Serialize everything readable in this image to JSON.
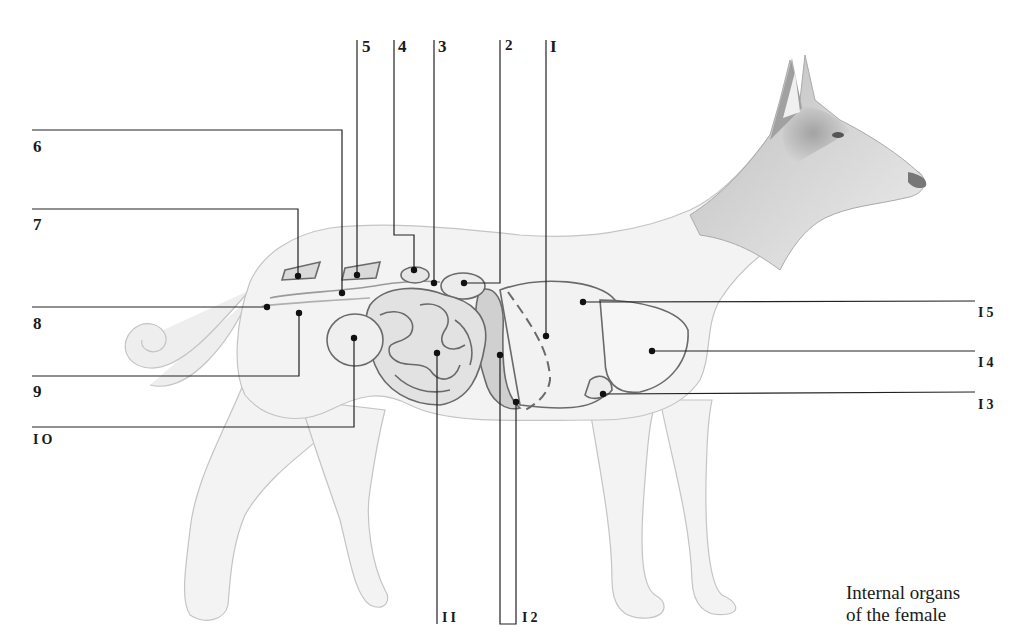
{
  "figure": {
    "caption_line1": "Internal organs",
    "caption_line2": "of the female"
  },
  "colors": {
    "line": "#222222",
    "organ_outline": "#6a6a6a",
    "body_shade": "#d9d9d9",
    "background": "#ffffff"
  },
  "labels": [
    {
      "id": "1",
      "text": "I",
      "pos": "top"
    },
    {
      "id": "2",
      "text": "2",
      "pos": "top"
    },
    {
      "id": "3",
      "text": "3",
      "pos": "top"
    },
    {
      "id": "4",
      "text": "4",
      "pos": "top"
    },
    {
      "id": "5",
      "text": "5",
      "pos": "top"
    },
    {
      "id": "6",
      "text": "6",
      "pos": "left"
    },
    {
      "id": "7",
      "text": "7",
      "pos": "left"
    },
    {
      "id": "8",
      "text": "8",
      "pos": "left"
    },
    {
      "id": "9",
      "text": "9",
      "pos": "left"
    },
    {
      "id": "10",
      "text": "IO",
      "pos": "left"
    },
    {
      "id": "11",
      "text": "II",
      "pos": "bottom"
    },
    {
      "id": "12",
      "text": "I2",
      "pos": "bottom"
    },
    {
      "id": "13",
      "text": "I3",
      "pos": "right"
    },
    {
      "id": "14",
      "text": "I4",
      "pos": "right"
    },
    {
      "id": "15",
      "text": "I5",
      "pos": "right"
    }
  ]
}
